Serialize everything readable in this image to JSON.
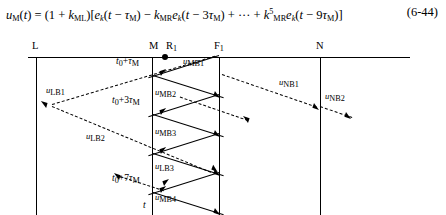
{
  "equation": {
    "number": "(6-44)",
    "lhs": "u_M(t)",
    "text": "u_M(t) = (1 + k_ML)[e_k(t − τ_M) − k_MR e_k(t − 3τ_M) + ⋯ + k^5_MR e_k(t − 9τ_M)]",
    "parts": {
      "u": "u",
      "u_sub": "M",
      "t1": "(t)",
      "eq": "=",
      "open1": "(1 +",
      "k1": "k",
      "k1_sub": "ML",
      "close1": ")[",
      "e1": "e",
      "e1_sub": "k",
      "arg1": "(t − τ",
      "arg1_sub": "M",
      "arg1_end": ") −",
      "k2": "k",
      "k2_sub": "MR",
      "e2": "e",
      "e2_sub": "k",
      "arg2": "(t − 3τ",
      "arg2_sub": "M",
      "arg2_end": ") + ⋯ +",
      "k3": "k",
      "k3_sup": "5",
      "k3_sub": "MR",
      "e3": "e",
      "e3_sub": "k",
      "arg3": "(t − 9τ",
      "arg3_sub": "M",
      "arg3_end": ")]"
    }
  },
  "axis": {
    "name": "position-axis",
    "tick_labels": [
      {
        "id": "L",
        "label": "L",
        "sub": ""
      },
      {
        "id": "M",
        "label": "M",
        "sub": ""
      },
      {
        "id": "R1",
        "label": "R",
        "sub": "1"
      },
      {
        "id": "F1",
        "label": "F",
        "sub": "1"
      },
      {
        "id": "N",
        "label": "N",
        "sub": ""
      }
    ],
    "time_axis_label": "t"
  },
  "time_labels": [
    {
      "id": "t1",
      "base": "t",
      "base_sub": "0",
      "rest": "+τ",
      "rest_sub": "M"
    },
    {
      "id": "t3",
      "base": "t",
      "base_sub": "0",
      "rest": "+3τ",
      "rest_sub": "M"
    },
    {
      "id": "t7",
      "base": "t",
      "base_sub": "0",
      "rest": "+7τ",
      "rest_sub": "M"
    }
  ],
  "wave_labels": [
    {
      "id": "uMB1",
      "u": "u",
      "sub": "MB1"
    },
    {
      "id": "uMB2",
      "u": "u",
      "sub": "MB2"
    },
    {
      "id": "uMB3",
      "u": "u",
      "sub": "MB3"
    },
    {
      "id": "uMB4",
      "u": "u",
      "sub": "MB4"
    },
    {
      "id": "uLB1",
      "u": "u",
      "sub": "LB1"
    },
    {
      "id": "uLB2",
      "u": "u",
      "sub": "LB2"
    },
    {
      "id": "uLB3",
      "u": "u",
      "sub": "LB3"
    },
    {
      "id": "uNB1",
      "u": "u",
      "sub": "NB1"
    },
    {
      "id": "uNB2",
      "u": "u",
      "sub": "NB2"
    }
  ],
  "colors": {
    "ink": "#000000",
    "paper": "#ffffff"
  }
}
